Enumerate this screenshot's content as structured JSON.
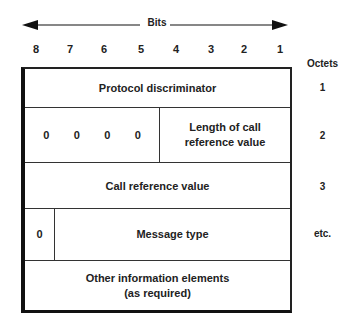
{
  "header": {
    "bits_label": "Bits",
    "bit_numbers": [
      "8",
      "7",
      "6",
      "5",
      "4",
      "3",
      "2",
      "1"
    ],
    "octets_label": "Octets"
  },
  "rows": [
    {
      "label": "Protocol discriminator",
      "octet": "1"
    },
    {
      "bits": [
        "0",
        "0",
        "0",
        "0"
      ],
      "label": "Length of call reference value",
      "octet": "2"
    },
    {
      "label": "Call reference value",
      "octet": "3"
    },
    {
      "bit": "0",
      "label": "Message type",
      "octet": "etc."
    },
    {
      "label": "Other information elements (as required)",
      "line1": "Other information elements",
      "line2": "(as required)"
    }
  ]
}
